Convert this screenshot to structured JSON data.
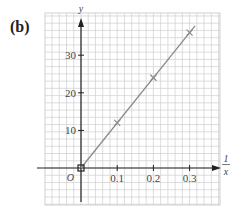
{
  "panel_label": "(b)",
  "chart_data": {
    "type": "line",
    "title": "",
    "xlabel": "1/x",
    "xlabel_numerator": "1",
    "xlabel_denominator": "x",
    "ylabel": "y",
    "origin_label": "O",
    "x": [
      0,
      0.1,
      0.2,
      0.3
    ],
    "series": [
      {
        "name": "y vs 1/x",
        "values": [
          0,
          12,
          24,
          36
        ],
        "marker": "cross"
      }
    ],
    "xticks": [
      "0.1",
      "0.2",
      "0.3"
    ],
    "yticks": [
      "10",
      "20",
      "30"
    ],
    "xlim": [
      -0.1,
      0.38
    ],
    "ylim": [
      -10,
      41
    ],
    "grid": true,
    "legend": "none"
  },
  "colors": {
    "grid": "#cfcfcf",
    "axis": "#222222",
    "line": "#8a8a8a",
    "text": "#444444"
  }
}
